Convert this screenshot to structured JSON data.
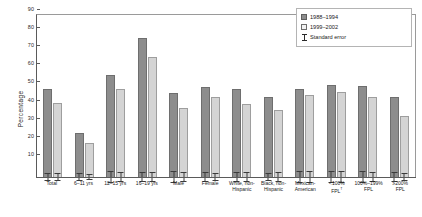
{
  "chart_data": {
    "type": "bar",
    "title": "",
    "xlabel": "",
    "ylabel": "Percentage",
    "ylim": [
      0,
      90
    ],
    "yticks": [
      10,
      20,
      30,
      40,
      50,
      60,
      70,
      80,
      90
    ],
    "grid": false,
    "legend_position": "top-right",
    "categories": [
      "Total",
      "6–11 yrs",
      "12–15 yrs",
      "16–19 yrs",
      "Male",
      "Female",
      "White, non-\nHispanic",
      "Black, non-\nHispanic",
      "Mexican-\nAmerican",
      "<100%\nFPL",
      "100%–199%\nFPL",
      "≥200%\nFPL"
    ],
    "category_footnotes": [
      "",
      "",
      "",
      "",
      "",
      "",
      "",
      "",
      "",
      "†",
      "",
      ""
    ],
    "series": [
      {
        "name": "1988–1994",
        "color": "#8d8d8d",
        "values": [
          49,
          25,
          57,
          77.5,
          47,
          50,
          49,
          45,
          49,
          51.5,
          51,
          45
        ],
        "errors": [
          2.2,
          2.3,
          3.6,
          2.6,
          3.4,
          2.6,
          2.6,
          2.2,
          3.4,
          3.4,
          3.2,
          2.6
        ]
      },
      {
        "name": "1999–2002",
        "color": "#d4d4d4",
        "values": [
          41.5,
          19.5,
          49,
          67,
          38.5,
          44.5,
          41,
          37.5,
          46,
          47.5,
          44.5,
          34.5
        ],
        "errors": [
          2.0,
          2.0,
          3.0,
          2.8,
          2.8,
          2.4,
          2.6,
          2.6,
          3.2,
          3.4,
          3.0,
          2.4
        ]
      }
    ],
    "error_bar_label": "Standard error"
  },
  "legend": {
    "items": [
      {
        "label": "1988–1994",
        "kind": "swatch-dark"
      },
      {
        "label": "1999–2002",
        "kind": "swatch-light"
      },
      {
        "label": "Standard error",
        "kind": "error-mark"
      }
    ]
  }
}
